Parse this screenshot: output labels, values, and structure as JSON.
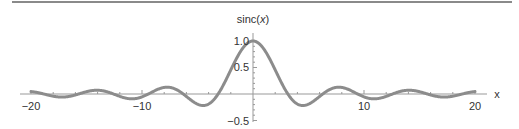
{
  "chart_data": {
    "type": "line",
    "title": "",
    "xlabel": "x",
    "ylabel": "sinc(x)",
    "function": "sin(x)/x",
    "xlim": [
      -20,
      20
    ],
    "ylim": [
      -0.5,
      1.0
    ],
    "xticks_major": [
      -20,
      -10,
      10,
      20
    ],
    "yticks_major": [
      -0.5,
      0.5,
      1.0
    ],
    "xtick_labels": [
      "−20",
      "−10",
      "10",
      "20"
    ],
    "ytick_labels": [
      "−0.5",
      "0.5",
      "1.0"
    ],
    "grid": false,
    "legend": null,
    "series": [
      {
        "name": "sinc(x)",
        "color": "#8c8c8c",
        "x": [
          -20,
          -18,
          -16,
          -14,
          -12,
          -10,
          -8,
          -6,
          -4,
          -2,
          0,
          2,
          4,
          6,
          8,
          10,
          12,
          14,
          16,
          18,
          20
        ],
        "values": [
          0.046,
          -0.042,
          -0.018,
          0.071,
          0.045,
          -0.054,
          0.124,
          -0.047,
          -0.189,
          0.455,
          1.0,
          0.455,
          -0.189,
          -0.047,
          0.124,
          -0.054,
          0.045,
          0.071,
          -0.018,
          -0.042,
          0.046
        ]
      }
    ]
  },
  "labels": {
    "ylabel": "sinc(x)",
    "ylabel_prefix": "sinc(",
    "ylabel_var": "x",
    "ylabel_suffix": ")",
    "xlabel": "x",
    "xticks": [
      "−20",
      "−10",
      "10",
      "20"
    ],
    "yticks": [
      "1.0",
      "0.5",
      "−0.5"
    ]
  },
  "colors": {
    "curve": "#8c8c8c",
    "axis": "#999999",
    "text": "#333333",
    "topline": "#8a8a8a"
  }
}
